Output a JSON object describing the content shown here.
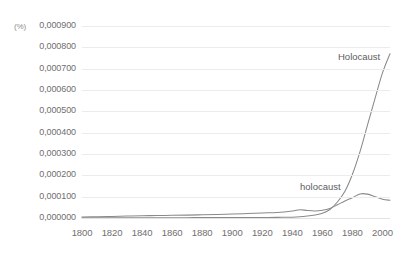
{
  "chart_data": {
    "type": "line",
    "title": "",
    "subtitle": "",
    "xlabel": "",
    "ylabel": "(%)",
    "grid": true,
    "legend_position": "inline-annotation",
    "xlim": [
      1800,
      2005
    ],
    "ylim": [
      0.0,
      0.0009
    ],
    "x_ticks": [
      1800,
      1820,
      1840,
      1860,
      1880,
      1900,
      1920,
      1940,
      1960,
      1980,
      2000
    ],
    "x_tick_labels": [
      "1800",
      "1820",
      "1840",
      "1860",
      "1880",
      "1900",
      "1920",
      "1940",
      "1960",
      "1980",
      "2000"
    ],
    "y_ticks": [
      0.0,
      0.0001,
      0.0002,
      0.0003,
      0.0004,
      0.0005,
      0.0006,
      0.0007,
      0.0008,
      0.0009
    ],
    "y_tick_labels": [
      "0,000900",
      "0,000800",
      "0,000700",
      "0,000600",
      "0,000500",
      "0,000400",
      "0,000300",
      "0,000200",
      "0,000100",
      "0,000000"
    ],
    "decimal_separator": ",",
    "line_color": "#8a8a8a",
    "grid_color": "#ececec",
    "x": [
      1800,
      1810,
      1820,
      1830,
      1840,
      1850,
      1860,
      1870,
      1880,
      1890,
      1900,
      1910,
      1920,
      1930,
      1940,
      1945,
      1950,
      1955,
      1960,
      1965,
      1970,
      1975,
      1980,
      1985,
      1990,
      1995,
      2000,
      2005
    ],
    "series": [
      {
        "name": "Holocaust",
        "label": "Holocaust",
        "values": [
          1e-06,
          1e-06,
          1.2e-06,
          1.2e-06,
          1.3e-06,
          1.4e-06,
          1.5e-06,
          1.6e-06,
          1.8e-06,
          2e-06,
          2.2e-06,
          2.4e-06,
          2.6e-06,
          3e-06,
          4e-06,
          5.5e-06,
          9e-06,
          1.4e-05,
          2.2e-05,
          4e-05,
          7.5e-05,
          0.000125,
          0.000205,
          0.00031,
          0.000435,
          0.00056,
          0.00068,
          0.00077
        ]
      },
      {
        "name": "holocaust",
        "label": "holocaust",
        "values": [
          5e-06,
          6e-06,
          7.5e-06,
          9e-06,
          1.05e-05,
          1.15e-05,
          1.25e-05,
          1.35e-05,
          1.5e-05,
          1.65e-05,
          1.85e-05,
          2.1e-05,
          2.35e-05,
          2.6e-05,
          3.3e-05,
          3.9e-05,
          3.5e-05,
          3.3e-05,
          3.6e-05,
          4.5e-05,
          6.2e-05,
          8e-05,
          9.5e-05,
          0.000113,
          0.000112,
          0.0001,
          8.8e-05,
          8.3e-05
        ]
      }
    ],
    "annotations": [
      {
        "text": "Holocaust",
        "series": "Holocaust"
      },
      {
        "text": "holocaust",
        "series": "holocaust"
      }
    ]
  }
}
